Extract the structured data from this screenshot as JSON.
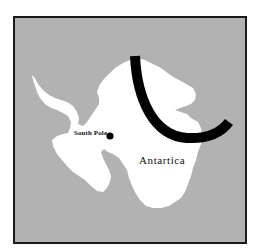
{
  "map": {
    "background_color": "#b2b2b2",
    "land_color": "#ffffff",
    "frame_color": "#1a1a1a",
    "arc_color": "#000000",
    "labels": {
      "south_pole": "South Pole",
      "continent": "Antartica"
    },
    "markers": [
      {
        "name": "south-pole-marker",
        "label": "South Pole",
        "shape": "filled-circle"
      }
    ],
    "overlays": [
      {
        "name": "curved-band",
        "shape": "thick-arc",
        "color": "#000000"
      }
    ]
  }
}
